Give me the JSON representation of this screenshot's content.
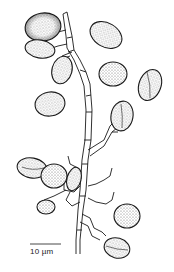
{
  "figure": {
    "scale_bar": {
      "label": "10 µm"
    },
    "colors": {
      "ink": "#1a1a1a",
      "stipple": "#555555",
      "background": "#ffffff"
    }
  }
}
